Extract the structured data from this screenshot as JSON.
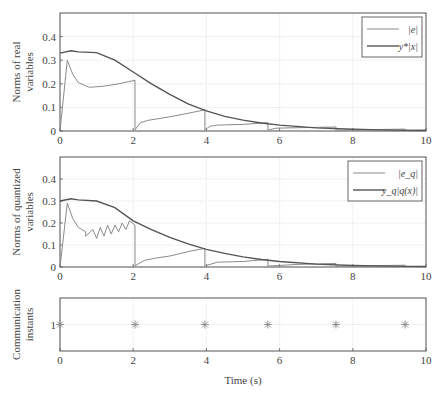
{
  "colors": {
    "light_series": "#8a8a8a",
    "dark_series": "#555555",
    "axis": "#555555",
    "grid": "#d8d8d8",
    "marker": "#888888"
  },
  "xlabel": "Time (s)",
  "chart_data": [
    {
      "type": "line",
      "title": "",
      "ylabel_line1": "Norms of real",
      "ylabel_line2": "variables",
      "xlim": [
        0,
        10
      ],
      "ylim": [
        0,
        0.5
      ],
      "xticks": [
        "0",
        "2",
        "4",
        "6",
        "8",
        "10"
      ],
      "yticks": [
        "0",
        "0.1",
        "0.2",
        "0.3",
        "0.4"
      ],
      "grid": true,
      "legend_position": "upper right",
      "series": [
        {
          "name": "|e|",
          "legend_label": "|e|",
          "color": "light",
          "x": [
            0,
            0.2,
            0.35,
            0.5,
            0.8,
            1.2,
            1.6,
            2.05,
            2.05,
            2.2,
            2.4,
            3.0,
            3.5,
            3.96,
            3.96,
            4.1,
            4.3,
            5.0,
            5.68,
            5.68,
            5.9,
            6.5,
            7.54,
            7.54,
            8.5,
            9.43,
            9.43,
            10
          ],
          "values": [
            0,
            0.3,
            0.24,
            0.205,
            0.185,
            0.19,
            0.2,
            0.215,
            0.005,
            0.035,
            0.045,
            0.06,
            0.075,
            0.09,
            0.005,
            0.02,
            0.025,
            0.028,
            0.035,
            0.004,
            0.012,
            0.014,
            0.017,
            0.003,
            0.006,
            0.008,
            0.002,
            0.004
          ]
        },
        {
          "name": "y*|x|",
          "legend_label": "y*|x|",
          "color": "dark",
          "x": [
            0,
            0.3,
            0.5,
            1.0,
            1.5,
            2.0,
            2.5,
            3.0,
            3.5,
            4.0,
            4.5,
            5.0,
            5.5,
            6.0,
            7.0,
            8.0,
            9.0,
            10
          ],
          "values": [
            0.33,
            0.34,
            0.335,
            0.332,
            0.3,
            0.25,
            0.2,
            0.155,
            0.115,
            0.085,
            0.062,
            0.046,
            0.034,
            0.025,
            0.013,
            0.007,
            0.004,
            0.002
          ]
        }
      ]
    },
    {
      "type": "line",
      "title": "",
      "ylabel_line1": "Norms of quantized",
      "ylabel_line2": "variables",
      "xlim": [
        0,
        10
      ],
      "ylim": [
        0,
        0.5
      ],
      "xticks": [
        "0",
        "2",
        "4",
        "6",
        "8",
        "10"
      ],
      "yticks": [
        "0",
        "0.1",
        "0.2",
        "0.3",
        "0.4"
      ],
      "grid": true,
      "legend_position": "upper right",
      "series": [
        {
          "name": "|e_q|",
          "legend_label": "|e_q|",
          "color": "light",
          "x": [
            0,
            0.2,
            0.35,
            0.5,
            0.7,
            0.7,
            0.9,
            1.0,
            1.1,
            1.2,
            1.3,
            1.4,
            1.5,
            1.6,
            1.7,
            1.8,
            1.9,
            2.05,
            2.05,
            2.3,
            2.6,
            3.0,
            3.5,
            3.96,
            3.96,
            4.3,
            5.0,
            5.68,
            5.68,
            6.5,
            7.54,
            7.54,
            8.5,
            9.43,
            9.43,
            10
          ],
          "values": [
            0,
            0.29,
            0.22,
            0.18,
            0.16,
            0.14,
            0.17,
            0.13,
            0.18,
            0.14,
            0.19,
            0.15,
            0.19,
            0.16,
            0.2,
            0.17,
            0.21,
            0.19,
            0.005,
            0.03,
            0.04,
            0.05,
            0.07,
            0.085,
            0.005,
            0.022,
            0.025,
            0.035,
            0.004,
            0.012,
            0.016,
            0.003,
            0.006,
            0.008,
            0.002,
            0.004
          ]
        },
        {
          "name": "y_q|q(x)|",
          "legend_label": "y_q|q(x)|",
          "color": "dark",
          "x": [
            0,
            0.3,
            0.5,
            1.0,
            1.5,
            2.0,
            2.5,
            3.0,
            3.5,
            4.0,
            4.5,
            5.0,
            5.5,
            6.0,
            7.0,
            8.0,
            9.0,
            10
          ],
          "values": [
            0.3,
            0.31,
            0.305,
            0.3,
            0.27,
            0.21,
            0.17,
            0.135,
            0.105,
            0.08,
            0.062,
            0.046,
            0.034,
            0.025,
            0.013,
            0.007,
            0.004,
            0.002
          ]
        }
      ]
    },
    {
      "type": "scatter",
      "title": "",
      "ylabel_line1": "Communication",
      "ylabel_line2": "instants",
      "xlabel": "Time (s)",
      "xlim": [
        0,
        10
      ],
      "ylim": [
        0.5,
        1.5
      ],
      "xticks": [
        "0",
        "2",
        "4",
        "6",
        "8",
        "10"
      ],
      "yticks": [
        "1"
      ],
      "grid": true,
      "marker": "asterisk",
      "series": [
        {
          "name": "communication instants",
          "x": [
            0,
            2.05,
            3.96,
            5.68,
            7.54,
            9.43
          ],
          "values": [
            1,
            1,
            1,
            1,
            1,
            1
          ]
        }
      ]
    }
  ]
}
